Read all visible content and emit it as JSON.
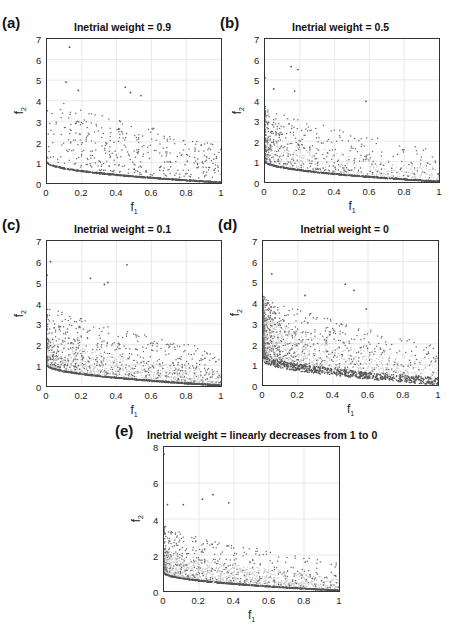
{
  "figure": {
    "panels": [
      {
        "id": "a",
        "label": "(a)",
        "title": "Inetrial weight = 0.9",
        "xlabel": "f",
        "xlabel_sub": "1",
        "ylabel": "f",
        "ylabel_sub": "2",
        "xticks": [
          "0",
          "0.2",
          "0.4",
          "0.6",
          "0.8",
          "1"
        ],
        "yticks": [
          "0",
          "1",
          "2",
          "3",
          "4",
          "5",
          "6",
          "7"
        ]
      },
      {
        "id": "b",
        "label": "(b)",
        "title": "Inetrial weight = 0.5",
        "xlabel": "f",
        "xlabel_sub": "1",
        "ylabel": "f",
        "ylabel_sub": "2",
        "xticks": [
          "0",
          "0.2",
          "0.4",
          "0.6",
          "0.8",
          "1"
        ],
        "yticks": [
          "0",
          "1",
          "2",
          "3",
          "4",
          "5",
          "6",
          "7"
        ]
      },
      {
        "id": "c",
        "label": "(c)",
        "title": "Inetrial weight = 0.1",
        "xlabel": "f",
        "xlabel_sub": "1",
        "ylabel": "f",
        "ylabel_sub": "2",
        "xticks": [
          "0",
          "0.2",
          "0.4",
          "0.6",
          "0.8",
          "1"
        ],
        "yticks": [
          "0",
          "1",
          "2",
          "3",
          "4",
          "5",
          "6",
          "7"
        ]
      },
      {
        "id": "d",
        "label": "(d)",
        "title": "Inetrial weight = 0",
        "xlabel": "f",
        "xlabel_sub": "1",
        "ylabel": "f",
        "ylabel_sub": "2",
        "xticks": [
          "0",
          "0.2",
          "0.4",
          "0.6",
          "0.8",
          "1"
        ],
        "yticks": [
          "0",
          "1",
          "2",
          "3",
          "4",
          "5",
          "6",
          "7"
        ]
      },
      {
        "id": "e",
        "label": "(e)",
        "title": "Inetrial weight = linearly decreases from 1 to 0",
        "xlabel": "f",
        "xlabel_sub": "1",
        "ylabel": "f",
        "ylabel_sub": "2",
        "xticks": [
          "0",
          "0.2",
          "0.4",
          "0.6",
          "0.8",
          "1"
        ],
        "yticks": [
          "0",
          "2",
          "4",
          "6",
          "8"
        ]
      }
    ]
  },
  "chart_data": [
    {
      "type": "scatter",
      "panel": "(a)",
      "title": "Inetrial weight = 0.9",
      "xlabel": "f1",
      "ylabel": "f2",
      "xlim": [
        0,
        1
      ],
      "ylim": [
        0,
        7
      ],
      "grid": true,
      "description": "Pareto front curve f2 ≈ 1 - sqrt(f1) (dense dark band from (0,1) to (1,0)) plus sparse dominated points mostly between f2=0.5 and 4",
      "front": {
        "x": [
          0,
          0.1,
          0.2,
          0.3,
          0.4,
          0.5,
          0.6,
          0.7,
          0.8,
          0.9,
          1.0
        ],
        "y": [
          1.0,
          0.68,
          0.55,
          0.45,
          0.37,
          0.29,
          0.23,
          0.16,
          0.11,
          0.05,
          0.0
        ]
      },
      "notable_points": [
        {
          "x": 0.13,
          "y": 6.6
        },
        {
          "x": 0.11,
          "y": 4.9
        },
        {
          "x": 0.45,
          "y": 4.65
        },
        {
          "x": 0.48,
          "y": 4.4
        },
        {
          "x": 0.18,
          "y": 4.5
        },
        {
          "x": 0.54,
          "y": 4.25
        }
      ]
    },
    {
      "type": "scatter",
      "panel": "(b)",
      "title": "Inetrial weight = 0.5",
      "xlabel": "f1",
      "ylabel": "f2",
      "xlim": [
        0,
        1
      ],
      "ylim": [
        0,
        7
      ],
      "grid": true,
      "description": "Pareto front f2 ≈ 1 - sqrt(f1) plus denser dominated points concentrated at f1<0.6, f2<3",
      "front": {
        "x": [
          0,
          0.1,
          0.2,
          0.3,
          0.4,
          0.5,
          0.6,
          0.7,
          0.8,
          0.9,
          1.0
        ],
        "y": [
          1.0,
          0.68,
          0.55,
          0.45,
          0.37,
          0.29,
          0.23,
          0.16,
          0.11,
          0.05,
          0.0
        ]
      },
      "notable_points": [
        {
          "x": 0.15,
          "y": 5.65
        },
        {
          "x": 0.19,
          "y": 5.5
        },
        {
          "x": 0.0,
          "y": 5.1
        },
        {
          "x": 0.05,
          "y": 4.55
        },
        {
          "x": 0.17,
          "y": 4.45
        },
        {
          "x": 0.58,
          "y": 3.95
        }
      ]
    },
    {
      "type": "scatter",
      "panel": "(c)",
      "title": "Inetrial weight = 0.1",
      "xlabel": "f1",
      "ylabel": "f2",
      "xlim": [
        0,
        1
      ],
      "ylim": [
        0,
        7
      ],
      "grid": true,
      "description": "Pareto front f2 ≈ 1 - sqrt(f1) with thick light-grey cloud just above it, plus dominated points up to ~6",
      "front": {
        "x": [
          0,
          0.1,
          0.2,
          0.3,
          0.4,
          0.5,
          0.6,
          0.7,
          0.8,
          0.9,
          1.0
        ],
        "y": [
          1.0,
          0.68,
          0.55,
          0.45,
          0.37,
          0.29,
          0.23,
          0.16,
          0.11,
          0.05,
          0.0
        ]
      },
      "notable_points": [
        {
          "x": 0.02,
          "y": 6.0
        },
        {
          "x": 0.46,
          "y": 5.85
        },
        {
          "x": 0.0,
          "y": 5.35
        },
        {
          "x": 0.25,
          "y": 5.2
        },
        {
          "x": 0.35,
          "y": 5.0
        },
        {
          "x": 0.33,
          "y": 4.9
        }
      ]
    },
    {
      "type": "scatter",
      "panel": "(d)",
      "title": "Inetrial weight = 0",
      "xlabel": "f1",
      "ylabel": "f2",
      "xlim": [
        0,
        1
      ],
      "ylim": [
        0,
        7
      ],
      "grid": true,
      "description": "No clean front; broad dark band from (0,1.2) to (1,0.1) with heavy scatter concentrated at f1<0.3, f2 up to 5.4",
      "front": {
        "x": [
          0,
          0.1,
          0.2,
          0.3,
          0.4,
          0.5,
          0.6,
          0.7,
          0.8,
          0.9,
          1.0
        ],
        "y": [
          1.2,
          0.9,
          0.75,
          0.6,
          0.5,
          0.42,
          0.35,
          0.28,
          0.2,
          0.15,
          0.1
        ]
      },
      "notable_points": [
        {
          "x": 0.05,
          "y": 5.4
        },
        {
          "x": 0.47,
          "y": 4.9
        },
        {
          "x": 0.52,
          "y": 4.6
        },
        {
          "x": 0.24,
          "y": 4.35
        },
        {
          "x": 0.59,
          "y": 3.7
        }
      ]
    },
    {
      "type": "scatter",
      "panel": "(e)",
      "title": "Inetrial weight = linearly decreases from 1 to 0",
      "xlabel": "f1",
      "ylabel": "f2",
      "xlim": [
        0,
        1
      ],
      "ylim": [
        0,
        8
      ],
      "grid": true,
      "description": "Pareto front f2 ≈ 1 - sqrt(f1) with grey cloud above it and dominated points up to ~5.4",
      "front": {
        "x": [
          0,
          0.1,
          0.2,
          0.3,
          0.4,
          0.5,
          0.6,
          0.7,
          0.8,
          0.9,
          1.0
        ],
        "y": [
          1.0,
          0.68,
          0.55,
          0.45,
          0.37,
          0.29,
          0.23,
          0.16,
          0.11,
          0.05,
          0.0
        ]
      },
      "notable_points": [
        {
          "x": 0.0,
          "y": 7.6
        },
        {
          "x": 0.28,
          "y": 5.35
        },
        {
          "x": 0.22,
          "y": 5.1
        },
        {
          "x": 0.02,
          "y": 4.8
        },
        {
          "x": 0.11,
          "y": 4.8
        },
        {
          "x": 0.37,
          "y": 4.9
        }
      ]
    }
  ]
}
